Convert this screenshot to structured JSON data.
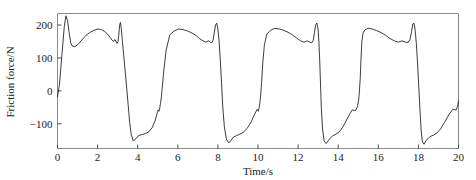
{
  "chart_data": {
    "type": "line",
    "title": "",
    "xlabel": "Time/s",
    "ylabel": "Friction force/N",
    "xlim": [
      0,
      20
    ],
    "ylim": [
      -175,
      235
    ],
    "xticks": [
      0,
      2,
      4,
      6,
      8,
      10,
      12,
      14,
      16,
      18,
      20
    ],
    "xticklabels": [
      "0",
      "2",
      "4",
      "6",
      "8",
      "10",
      "12",
      "14",
      "16",
      "18",
      "20"
    ],
    "yticks": [
      -100,
      0,
      100,
      200
    ],
    "yticklabels": [
      "−100",
      "0",
      "100",
      "200"
    ],
    "grid": false,
    "legend": null,
    "series": [
      {
        "name": "Friction force",
        "x": [
          0.0,
          0.1,
          0.22,
          0.34,
          0.42,
          0.5,
          0.58,
          0.66,
          0.74,
          0.86,
          1.0,
          1.18,
          1.38,
          1.6,
          1.82,
          2.02,
          2.2,
          2.36,
          2.5,
          2.62,
          2.72,
          2.8,
          2.86,
          2.92,
          2.97,
          3.02,
          3.06,
          3.1,
          3.14,
          3.18,
          3.24,
          3.32,
          3.42,
          3.52,
          3.6,
          3.68,
          3.78,
          3.9,
          4.04,
          4.2,
          4.38,
          4.56,
          4.72,
          4.86,
          4.96,
          5.02,
          5.06,
          5.1,
          5.14,
          5.18,
          5.22,
          5.3,
          5.42,
          5.6,
          5.82,
          6.04,
          6.26,
          6.48,
          6.7,
          6.92,
          7.1,
          7.26,
          7.4,
          7.52,
          7.62,
          7.7,
          7.76,
          7.82,
          7.88,
          7.94,
          8.0,
          8.06,
          8.12,
          8.18,
          8.24,
          8.32,
          8.42,
          8.54,
          8.66,
          8.78,
          8.92,
          9.08,
          9.26,
          9.46,
          9.66,
          9.84,
          9.96,
          10.02,
          10.06,
          10.1,
          10.14,
          10.18,
          10.24,
          10.32,
          10.44,
          10.62,
          10.84,
          11.06,
          11.28,
          11.5,
          11.72,
          11.94,
          12.12,
          12.3,
          12.46,
          12.58,
          12.68,
          12.76,
          12.82,
          12.88,
          12.94,
          13.0,
          13.04,
          13.08,
          13.12,
          13.16,
          13.22,
          13.3,
          13.4,
          13.52,
          13.62,
          13.72,
          13.84,
          13.98,
          14.14,
          14.32,
          14.52,
          14.7,
          14.86,
          14.96,
          15.02,
          15.06,
          15.1,
          15.14,
          15.18,
          15.24,
          15.34,
          15.5,
          15.7,
          15.92,
          16.14,
          16.36,
          16.58,
          16.8,
          17.0,
          17.18,
          17.34,
          17.48,
          17.58,
          17.66,
          17.72,
          17.78,
          17.84,
          17.9,
          17.96,
          18.02,
          18.08,
          18.14,
          18.2,
          18.28,
          18.38,
          18.5,
          18.62,
          18.76,
          18.92,
          19.1,
          19.3,
          19.52,
          19.72,
          19.88,
          19.96,
          20.0
        ],
        "y": [
          -18,
          20,
          110,
          196,
          228,
          214,
          176,
          146,
          136,
          134,
          140,
          152,
          166,
          177,
          184,
          188,
          186,
          180,
          172,
          163,
          154,
          150,
          156,
          150,
          144,
          150,
          172,
          200,
          208,
          190,
          150,
          96,
          30,
          -40,
          -96,
          -134,
          -152,
          -146,
          -136,
          -133,
          -130,
          -124,
          -112,
          -92,
          -70,
          -58,
          -62,
          -52,
          -36,
          -20,
          8,
          60,
          124,
          170,
          182,
          188,
          186,
          182,
          176,
          168,
          158,
          152,
          148,
          152,
          148,
          146,
          154,
          176,
          200,
          206,
          188,
          150,
          94,
          26,
          -46,
          -108,
          -146,
          -158,
          -150,
          -140,
          -136,
          -132,
          -126,
          -114,
          -94,
          -70,
          -56,
          -62,
          -50,
          -32,
          -8,
          26,
          86,
          140,
          172,
          184,
          190,
          188,
          184,
          178,
          170,
          160,
          152,
          148,
          152,
          148,
          146,
          154,
          178,
          202,
          206,
          186,
          146,
          88,
          18,
          -54,
          -116,
          -152,
          -160,
          -150,
          -142,
          -137,
          -133,
          -128,
          -118,
          -100,
          -76,
          -58,
          -60,
          -48,
          -28,
          0,
          40,
          100,
          150,
          176,
          186,
          190,
          188,
          183,
          177,
          169,
          159,
          152,
          148,
          152,
          148,
          147,
          156,
          180,
          203,
          206,
          184,
          142,
          82,
          12,
          -60,
          -122,
          -155,
          -162,
          -151,
          -143,
          -138,
          -134,
          -128,
          -116,
          -96,
          -72,
          -56,
          -58,
          -46,
          -30
        ]
      }
    ]
  },
  "axis": {
    "ylabel": "Friction force/N",
    "xlabel": "Time/s"
  }
}
